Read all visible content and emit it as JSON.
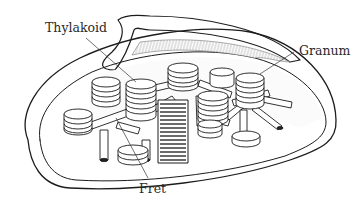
{
  "figure": {
    "labels": {
      "thylakoid": "Thylakoid",
      "granum": "Granum",
      "fret": "Fret"
    }
  },
  "colors": {
    "ink": "#1c1c1c",
    "stroma_shade": "#d8d8d8",
    "background": "#ffffff"
  }
}
